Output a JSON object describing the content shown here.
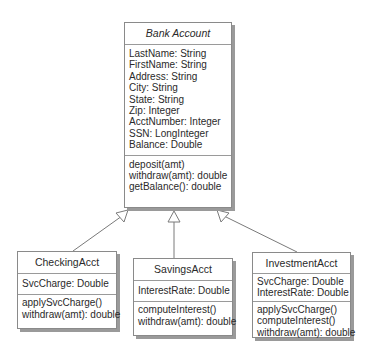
{
  "diagram": {
    "type": "UML class diagram",
    "colors": {
      "border": "#8a8a8a",
      "shadow": "#9a9a9a",
      "line": "#7a7a7a",
      "text": "#2a2a2a"
    },
    "classes": [
      {
        "name": "Bank Account",
        "abstract": true,
        "attributes": [
          "LastName: String",
          "FirstName: String",
          "Address: String",
          "City: String",
          "State: String",
          "Zip: Integer",
          "AcctNumber: Integer",
          "SSN: LongInteger",
          "Balance: Double"
        ],
        "methods": [
          "deposit(amt)",
          "withdraw(amt): double",
          "getBalance(): double"
        ]
      },
      {
        "name": "CheckingAcct",
        "attributes": [
          "SvcCharge: Double"
        ],
        "methods": [
          "applySvcCharge()",
          "withdraw(amt): double"
        ]
      },
      {
        "name": "SavingsAcct",
        "attributes": [
          "InterestRate: Double"
        ],
        "methods": [
          "computeInterest()",
          "withdraw(amt): double"
        ]
      },
      {
        "name": "InvestmentAcct",
        "attributes": [
          "SvcCharge: Double",
          "InterestRate: Double"
        ],
        "methods": [
          "applySvcCharge()",
          "computeInterest()",
          "withdraw(amt): double"
        ]
      }
    ],
    "relationships": [
      {
        "type": "generalization",
        "from": "CheckingAcct",
        "to": "Bank Account"
      },
      {
        "type": "generalization",
        "from": "SavingsAcct",
        "to": "Bank Account"
      },
      {
        "type": "generalization",
        "from": "InvestmentAcct",
        "to": "Bank Account"
      }
    ]
  }
}
